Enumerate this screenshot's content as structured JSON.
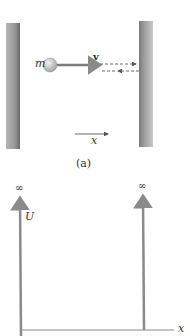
{
  "figure_a": {
    "mass_label": "m",
    "velocity_label": "v",
    "axis_label": "x",
    "caption": "(a)"
  },
  "figure_b": {
    "y_axis_label": "U",
    "x_axis_label": "x",
    "left_wall_value": "∞",
    "right_wall_value": "∞"
  },
  "colors": {
    "wall": "#9a9a9a",
    "wall_edge": "#6e6e6e",
    "arrow": "#777777",
    "ball": "#c9c9c9",
    "text": "#333333"
  }
}
